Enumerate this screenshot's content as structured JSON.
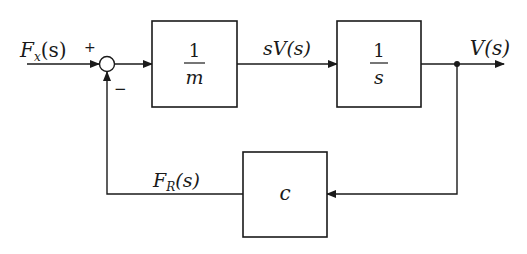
{
  "diagram": {
    "type": "block-diagram",
    "input": {
      "label_main": "F",
      "label_sub": "x",
      "label_arg": "(s)"
    },
    "summing_junction": {
      "plus_sign": "+",
      "minus_sign": "−"
    },
    "blocks": [
      {
        "id": "mass",
        "numerator": "1",
        "denominator": "m"
      },
      {
        "id": "integrator",
        "numerator": "1",
        "denominator": "s"
      },
      {
        "id": "damping",
        "label": "c"
      }
    ],
    "signals": {
      "intermediate": "sV(s)",
      "output": "V(s)",
      "feedback": {
        "label_main": "F",
        "label_sub": "R",
        "label_arg": "(s)"
      }
    }
  }
}
